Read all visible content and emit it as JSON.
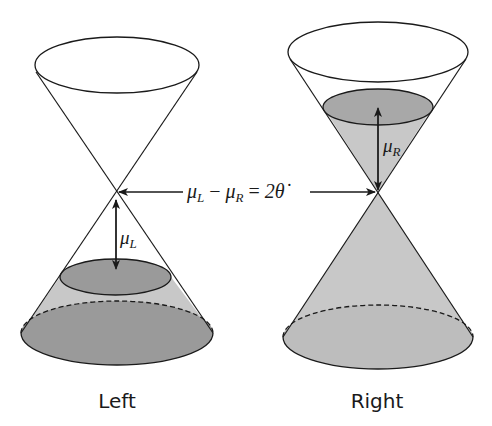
{
  "diagram": {
    "type": "double-cone (Fermi/Dirac cone) schematic",
    "colors": {
      "stroke": "#1a1a1a",
      "fill_light": "#c8c8c8",
      "fill_dark": "#9a9a9a",
      "background": "#ffffff"
    },
    "panels": [
      {
        "id": "left",
        "caption": "Left",
        "level_label": {
          "symbol": "μ",
          "subscript": "L"
        },
        "filled_region": "lower cone below apex, filled up to μ_L below apex"
      },
      {
        "id": "right",
        "caption": "Right",
        "level_label": {
          "symbol": "μ",
          "subscript": "R"
        },
        "filled_region": "entire lower cone plus upper cone up to μ_R above apex"
      }
    ],
    "equation": {
      "lhs_1": {
        "symbol": "μ",
        "subscript": "L"
      },
      "minus": "−",
      "lhs_2": {
        "symbol": "μ",
        "subscript": "R"
      },
      "equals": "=",
      "rhs": "2θ̇"
    }
  }
}
